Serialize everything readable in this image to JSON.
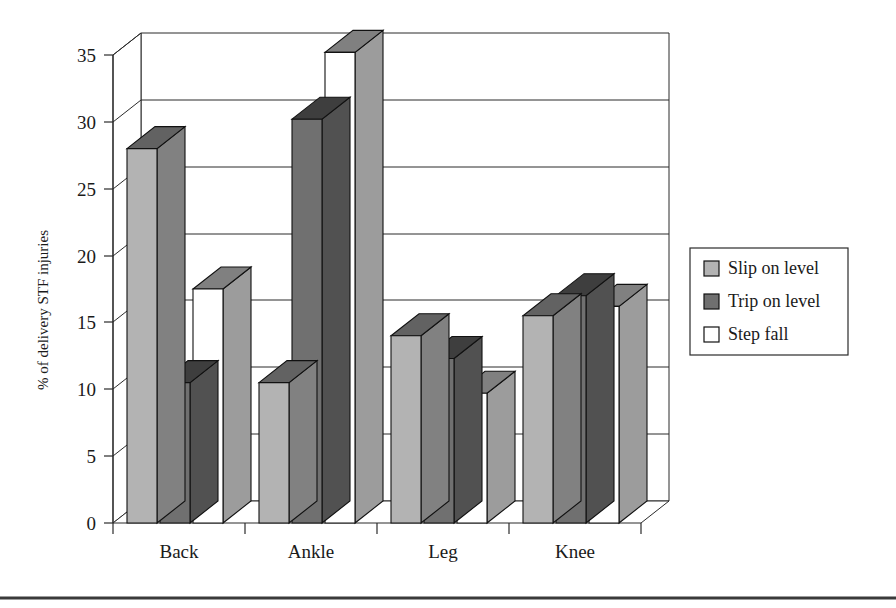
{
  "figure": {
    "background_color": "#ffffff",
    "bottom_rule_color": "#3a3a3a"
  },
  "chart_data": {
    "type": "bar",
    "style": "3d-clustered-column",
    "title": "",
    "xlabel": "",
    "ylabel": "% of delivery STF injuries",
    "categories": [
      "Back",
      "Ankle",
      "Leg",
      "Knee"
    ],
    "series": [
      {
        "name": "Slip on level",
        "color": "#b3b3b3",
        "values": [
          28.0,
          10.5,
          14.0,
          15.5
        ]
      },
      {
        "name": "Trip on level",
        "color": "#707070",
        "values": [
          10.5,
          30.2,
          12.3,
          17.0
        ]
      },
      {
        "name": "Step fall",
        "color": "#ffffff",
        "values": [
          17.5,
          35.2,
          9.7,
          16.2
        ]
      }
    ],
    "ylim": [
      0,
      35
    ],
    "yticks": [
      0,
      5,
      10,
      15,
      20,
      25,
      30,
      35
    ],
    "ytick_labels": [
      "0",
      "5",
      "10",
      "15",
      "20",
      "25",
      "30",
      "35"
    ],
    "grid": "horizontal",
    "legend_position": "right",
    "legend_entries": [
      "Slip on level",
      "Trip on level",
      "Step fall"
    ]
  },
  "legend": {
    "items": [
      {
        "label": "Slip on level",
        "swatch": "#b3b3b3"
      },
      {
        "label": "Trip on level",
        "swatch": "#707070"
      },
      {
        "label": "Step fall",
        "swatch": "#ffffff"
      }
    ]
  }
}
